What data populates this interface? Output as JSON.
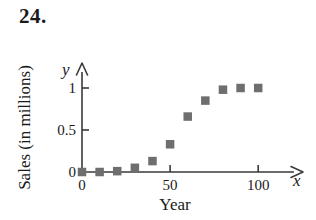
{
  "figure": {
    "problem_number": "24.",
    "marker_color": "#6e6e6e",
    "axis_color": "#3a3a3a"
  },
  "chart_data": {
    "type": "scatter",
    "title": "",
    "xlabel": "Year",
    "ylabel": "Sales (in millions)",
    "x_axis_letter": "y",
    "y_axis_letter": "x",
    "xlim": [
      0,
      110
    ],
    "ylim": [
      0,
      1.12
    ],
    "grid": false,
    "legend": null,
    "xticks": [
      {
        "value": 0,
        "label": "0"
      },
      {
        "value": 50,
        "label": "50"
      },
      {
        "value": 100,
        "label": "100"
      }
    ],
    "yticks": [
      {
        "value": 0,
        "label": "0"
      },
      {
        "value": 0.5,
        "label": "0.5"
      },
      {
        "value": 1,
        "label": "1"
      }
    ],
    "x": [
      0,
      10,
      20,
      30,
      40,
      50,
      60,
      70,
      80,
      90,
      100
    ],
    "y": [
      0.0,
      0.0,
      0.01,
      0.05,
      0.13,
      0.33,
      0.66,
      0.85,
      0.98,
      1.0,
      1.0
    ],
    "points": [
      {
        "x": 0,
        "y": 0.0
      },
      {
        "x": 10,
        "y": 0.0
      },
      {
        "x": 20,
        "y": 0.01
      },
      {
        "x": 30,
        "y": 0.05
      },
      {
        "x": 40,
        "y": 0.13
      },
      {
        "x": 50,
        "y": 0.33
      },
      {
        "x": 60,
        "y": 0.66
      },
      {
        "x": 70,
        "y": 0.85
      },
      {
        "x": 80,
        "y": 0.98
      },
      {
        "x": 90,
        "y": 1.0
      },
      {
        "x": 100,
        "y": 1.0
      }
    ]
  }
}
